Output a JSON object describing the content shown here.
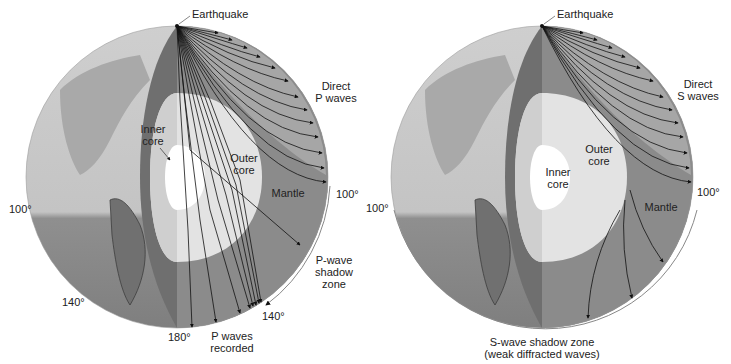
{
  "left_panel": {
    "title": "P-wave paths",
    "earthquake_label": "Earthquake",
    "direct_waves_label_1": "Direct",
    "direct_waves_label_2": "P waves",
    "inner_core_label_1": "Inner",
    "inner_core_label_2": "core",
    "outer_core_label_1": "Outer",
    "outer_core_label_2": "core",
    "mantle_label": "Mantle",
    "shadow_label_1": "P-wave",
    "shadow_label_2": "shadow",
    "shadow_label_3": "zone",
    "recorded_label_1": "P waves",
    "recorded_label_2": "recorded",
    "deg_100_left": "100°",
    "deg_100_right": "100°",
    "deg_140_left": "140°",
    "deg_140_right": "140°",
    "deg_180": "180°"
  },
  "right_panel": {
    "title": "S-wave paths",
    "earthquake_label": "Earthquake",
    "direct_waves_label_1": "Direct",
    "direct_waves_label_2": "S waves",
    "inner_core_label_1": "Inner",
    "inner_core_label_2": "core",
    "outer_core_label_1": "Outer",
    "outer_core_label_2": "core",
    "mantle_label": "Mantle",
    "deg_100_left": "100°",
    "deg_100_right": "100°",
    "shadow_label_1": "S-wave shadow zone",
    "shadow_label_2": "(weak diffracted waves)"
  },
  "colors": {
    "background": "#ffffff",
    "globe_land": "#b9b9b9",
    "globe_ocean": "#d6d6d6",
    "globe_south": "#8c8c8c",
    "mantle_dark": "#6f6f6f",
    "mantle_mid": "#8e8e8e",
    "mantle_light": "#a8a8a8",
    "outer_core": "#e2e2e2",
    "inner_core": "#ffffff",
    "ray": "#111111",
    "text": "#222222"
  }
}
